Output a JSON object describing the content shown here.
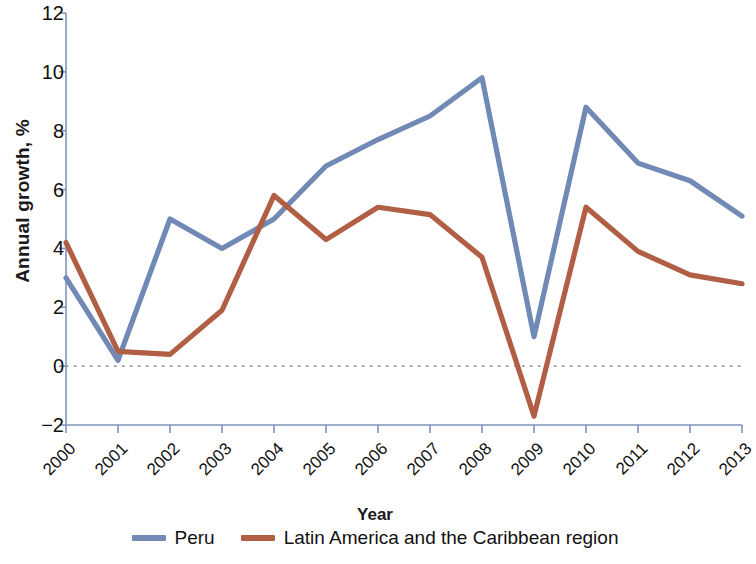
{
  "chart_data": {
    "type": "line",
    "title": "",
    "xlabel": "Year",
    "ylabel": "Annual growth, %",
    "grid": false,
    "zero_line": true,
    "legend_position": "bottom",
    "x": [
      2000,
      2001,
      2002,
      2003,
      2004,
      2005,
      2006,
      2007,
      2008,
      2009,
      2010,
      2011,
      2012,
      2013
    ],
    "categories": [
      "2000",
      "2001",
      "2002",
      "2003",
      "2004",
      "2005",
      "2006",
      "2007",
      "2008",
      "2009",
      "2010",
      "2011",
      "2012",
      "2013"
    ],
    "xlim": [
      2000,
      2013
    ],
    "ylim": [
      -2,
      12
    ],
    "yticks": [
      12,
      10,
      8,
      6,
      4,
      2,
      0,
      -2
    ],
    "ytick_labels": [
      "12",
      "10",
      "8",
      "6",
      "4",
      "2",
      "0",
      "−2"
    ],
    "series": [
      {
        "name": "Peru",
        "color": "#7189b5",
        "values": [
          3.0,
          0.2,
          5.0,
          4.0,
          5.0,
          6.8,
          7.7,
          8.5,
          9.8,
          1.0,
          8.8,
          6.9,
          6.3,
          5.1
        ]
      },
      {
        "name": "Latin America and the Caribbean region",
        "color": "#b05f45",
        "values": [
          4.2,
          0.5,
          0.4,
          1.9,
          5.8,
          4.3,
          5.4,
          5.15,
          3.7,
          -1.7,
          5.4,
          3.9,
          3.1,
          2.8
        ]
      }
    ]
  },
  "axes": {
    "ylabel": "Annual growth, %",
    "xlabel": "Year"
  },
  "legend": {
    "items": [
      {
        "label": "Peru",
        "color": "#7189b5"
      },
      {
        "label": "Latin America and the Caribbean region",
        "color": "#b05f45"
      }
    ]
  },
  "colors": {
    "peru": "#7189b5",
    "lac": "#b05f45",
    "axis": "#8193bd",
    "zero_line": "#9a9a9a",
    "text": "#111111"
  }
}
